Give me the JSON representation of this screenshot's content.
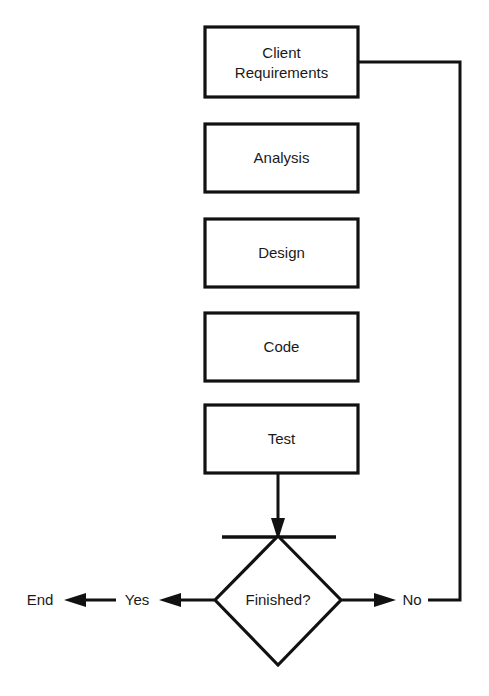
{
  "diagram": {
    "type": "flowchart",
    "line_color": "#111111",
    "text_color": "#1a1a1a",
    "background_color": "#ffffff"
  },
  "nodes": [
    {
      "id": "client-requirements",
      "shape": "process",
      "line1": "Client",
      "line2": "Requirements"
    },
    {
      "id": "analysis",
      "shape": "process",
      "label": "Analysis"
    },
    {
      "id": "design",
      "shape": "process",
      "label": "Design"
    },
    {
      "id": "code",
      "shape": "process",
      "label": "Code"
    },
    {
      "id": "test",
      "shape": "process",
      "label": "Test"
    },
    {
      "id": "finished",
      "shape": "decision",
      "label": "Finished?"
    },
    {
      "id": "end",
      "shape": "terminator",
      "label": "End"
    }
  ],
  "edges": [
    {
      "id": "test-to-finished",
      "from": "test",
      "to": "finished",
      "label": ""
    },
    {
      "id": "finished-yes",
      "from": "finished",
      "to": "end",
      "label": "Yes"
    },
    {
      "id": "finished-no",
      "from": "finished",
      "to": "client-requirements",
      "label": "No"
    }
  ],
  "labels": {
    "yes": "Yes",
    "no": "No",
    "end": "End"
  }
}
